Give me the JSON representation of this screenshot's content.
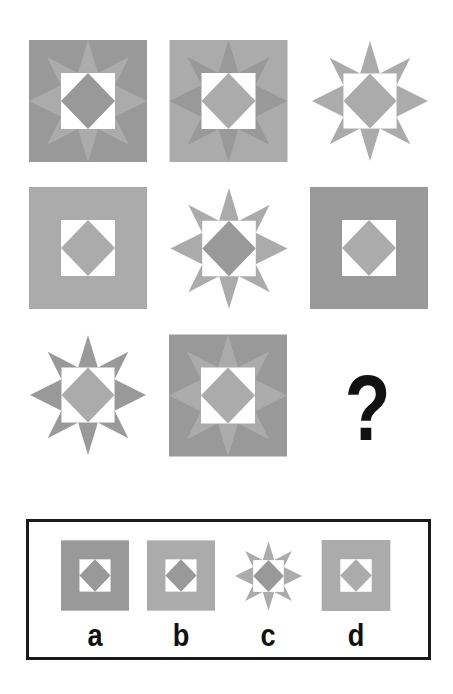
{
  "puzzle": {
    "type": "matrix-reasoning-3x3",
    "colors": {
      "dark": "#999999",
      "light": "#ababab",
      "white": "#ffffff",
      "ink": "#111111"
    },
    "grid": [
      {
        "row": 1,
        "col": 1,
        "background": "dark-square",
        "star": "light",
        "diamond": "dark"
      },
      {
        "row": 1,
        "col": 2,
        "background": "light-square",
        "star": "dark",
        "diamond": "light"
      },
      {
        "row": 1,
        "col": 3,
        "background": "none",
        "star": "light",
        "diamond": "light"
      },
      {
        "row": 2,
        "col": 1,
        "background": "light-square",
        "star": "none",
        "diamond": "light"
      },
      {
        "row": 2,
        "col": 2,
        "background": "none",
        "star": "light",
        "diamond": "dark"
      },
      {
        "row": 2,
        "col": 3,
        "background": "dark-square",
        "star": "none",
        "diamond": "light"
      },
      {
        "row": 3,
        "col": 1,
        "background": "none",
        "star": "dark",
        "diamond": "light"
      },
      {
        "row": 3,
        "col": 2,
        "background": "dark-square",
        "star": "light",
        "diamond": "light"
      },
      {
        "row": 3,
        "col": 3,
        "missing": true,
        "symbol": "?"
      }
    ],
    "missing_symbol": "?"
  },
  "options": [
    {
      "label": "a",
      "background": "dark-square",
      "star": "none",
      "diamond": "dark"
    },
    {
      "label": "b",
      "background": "light-square",
      "star": "none",
      "diamond": "dark"
    },
    {
      "label": "c",
      "background": "none",
      "star": "light",
      "diamond": "dark"
    },
    {
      "label": "d",
      "background": "light-square",
      "star": "none",
      "diamond": "light"
    }
  ]
}
